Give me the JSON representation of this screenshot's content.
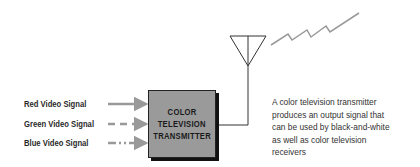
{
  "diagram": {
    "inputs": [
      {
        "label": "Red Video Signal",
        "line_style": "solid"
      },
      {
        "label": "Green Video Signal",
        "line_style": "dashed"
      },
      {
        "label": "Blue Video Signal",
        "line_style": "dash-dot"
      }
    ],
    "transmitter_box": {
      "lines": [
        "COLOR",
        "TELEVISION",
        "TRANSMITTER"
      ],
      "fill_color": "#9a9a9a"
    },
    "antenna": {
      "icon": "antenna-icon",
      "signal": "zigzag-wave-icon"
    },
    "description": {
      "lines": [
        "A color television transmitter",
        "produces an output signal that",
        "can be used by black-and-white",
        "as well as color television",
        "receivers"
      ]
    },
    "arrow_color": "#999999"
  }
}
